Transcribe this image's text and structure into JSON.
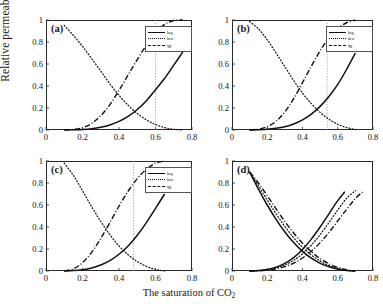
{
  "figure": {
    "ylabel": "Relative permeability",
    "xlabel_main": "The saturation of CO",
    "xlabel_sub": "2"
  },
  "legend": {
    "entries": [
      {
        "label": "krg",
        "style": "solid"
      },
      {
        "label": "krw",
        "style": "dotted"
      },
      {
        "label": "qg",
        "style": "dashdot"
      }
    ]
  },
  "panels": [
    {
      "tag": "(a)",
      "has_legend": true
    },
    {
      "tag": "(b)",
      "has_legend": true
    },
    {
      "tag": "(c)",
      "has_legend": true
    },
    {
      "tag": "(d)",
      "has_legend": false
    }
  ],
  "chart_data": {
    "type": "line",
    "title": "",
    "xlabel": "The saturation of CO2",
    "ylabel": "Relative permeability",
    "xlim": [
      0,
      0.8
    ],
    "ylim": [
      0,
      1
    ],
    "xticks": [
      0,
      0.2,
      0.4,
      0.6,
      0.8
    ],
    "yticks": [
      0,
      0.2,
      0.4,
      0.6,
      0.8,
      1
    ],
    "xtick_labels": [
      "0",
      "0.2",
      "0.4",
      "0.6",
      "0.8"
    ],
    "ytick_labels": [
      "0",
      "0.2",
      "0.4",
      "0.6",
      "0.8",
      "1"
    ],
    "grid": false,
    "legend_position": "upper right",
    "panels": [
      {
        "tag": "(a)",
        "vertical_reference_line": 0.6,
        "series": [
          {
            "name": "krg",
            "style": "solid",
            "x": [
              0.1,
              0.15,
              0.2,
              0.25,
              0.3,
              0.35,
              0.4,
              0.45,
              0.5,
              0.55,
              0.6,
              0.65,
              0.7,
              0.75
            ],
            "y": [
              0.0,
              0.002,
              0.005,
              0.012,
              0.025,
              0.046,
              0.078,
              0.124,
              0.186,
              0.266,
              0.366,
              0.47,
              0.59,
              0.71
            ]
          },
          {
            "name": "krw",
            "style": "dotted",
            "x": [
              0.1,
              0.15,
              0.2,
              0.25,
              0.3,
              0.35,
              0.4,
              0.45,
              0.5,
              0.55,
              0.6,
              0.65,
              0.7,
              0.75
            ],
            "y": [
              0.95,
              0.86,
              0.76,
              0.65,
              0.535,
              0.42,
              0.315,
              0.225,
              0.15,
              0.092,
              0.05,
              0.022,
              0.006,
              0.0
            ]
          },
          {
            "name": "qg",
            "style": "dashdot",
            "x": [
              0.1,
              0.15,
              0.2,
              0.25,
              0.3,
              0.35,
              0.4,
              0.45,
              0.5,
              0.55,
              0.6,
              0.65,
              0.7,
              0.75
            ],
            "y": [
              0.0,
              0.005,
              0.02,
              0.06,
              0.13,
              0.23,
              0.36,
              0.5,
              0.64,
              0.77,
              0.88,
              0.96,
              0.995,
              1.0
            ]
          }
        ]
      },
      {
        "tag": "(b)",
        "vertical_reference_line": 0.54,
        "series": [
          {
            "name": "krg",
            "style": "solid",
            "x": [
              0.1,
              0.15,
              0.2,
              0.25,
              0.3,
              0.35,
              0.4,
              0.45,
              0.5,
              0.55,
              0.6,
              0.65,
              0.7
            ],
            "y": [
              0.0,
              0.002,
              0.006,
              0.015,
              0.03,
              0.055,
              0.092,
              0.145,
              0.215,
              0.305,
              0.415,
              0.55,
              0.7
            ]
          },
          {
            "name": "krw",
            "style": "dotted",
            "x": [
              0.1,
              0.15,
              0.2,
              0.25,
              0.3,
              0.35,
              0.4,
              0.45,
              0.5,
              0.55,
              0.6,
              0.65,
              0.7
            ],
            "y": [
              0.985,
              0.92,
              0.82,
              0.7,
              0.575,
              0.45,
              0.335,
              0.24,
              0.16,
              0.098,
              0.052,
              0.022,
              0.005
            ]
          },
          {
            "name": "qg",
            "style": "dashdot",
            "x": [
              0.1,
              0.15,
              0.2,
              0.25,
              0.3,
              0.35,
              0.4,
              0.45,
              0.5,
              0.55,
              0.6,
              0.65,
              0.7
            ],
            "y": [
              0.0,
              0.008,
              0.03,
              0.08,
              0.165,
              0.285,
              0.43,
              0.58,
              0.72,
              0.84,
              0.925,
              0.975,
              1.0
            ]
          }
        ]
      },
      {
        "tag": "(c)",
        "vertical_reference_line": 0.48,
        "series": [
          {
            "name": "krg",
            "style": "solid",
            "x": [
              0.1,
              0.15,
              0.2,
              0.25,
              0.3,
              0.35,
              0.4,
              0.45,
              0.5,
              0.55,
              0.6,
              0.65
            ],
            "y": [
              0.0,
              0.004,
              0.012,
              0.028,
              0.055,
              0.095,
              0.152,
              0.228,
              0.325,
              0.44,
              0.57,
              0.7
            ]
          },
          {
            "name": "krw",
            "style": "dotted",
            "x": [
              0.1,
              0.15,
              0.2,
              0.25,
              0.3,
              0.35,
              0.4,
              0.45,
              0.5,
              0.55,
              0.6,
              0.65
            ],
            "y": [
              0.98,
              0.87,
              0.73,
              0.585,
              0.45,
              0.33,
              0.228,
              0.148,
              0.086,
              0.042,
              0.014,
              0.0
            ]
          },
          {
            "name": "qg",
            "style": "dashdot",
            "x": [
              0.1,
              0.15,
              0.2,
              0.25,
              0.3,
              0.35,
              0.4,
              0.45,
              0.5,
              0.55,
              0.6,
              0.65
            ],
            "y": [
              0.0,
              0.02,
              0.075,
              0.17,
              0.295,
              0.44,
              0.59,
              0.725,
              0.84,
              0.925,
              0.98,
              1.0
            ]
          }
        ]
      },
      {
        "tag": "(d)",
        "vertical_reference_line": null,
        "series": [
          {
            "name": "rising-solid",
            "style": "solid",
            "x": [
              0.1,
              0.15,
              0.2,
              0.25,
              0.3,
              0.35,
              0.4,
              0.45,
              0.5,
              0.55,
              0.6,
              0.64
            ],
            "y": [
              0.0,
              0.004,
              0.014,
              0.035,
              0.07,
              0.122,
              0.195,
              0.29,
              0.4,
              0.52,
              0.64,
              0.72
            ]
          },
          {
            "name": "rising-dotted",
            "style": "dotted",
            "x": [
              0.1,
              0.15,
              0.2,
              0.25,
              0.3,
              0.35,
              0.4,
              0.45,
              0.5,
              0.55,
              0.6,
              0.65,
              0.7
            ],
            "y": [
              0.0,
              0.003,
              0.011,
              0.027,
              0.055,
              0.097,
              0.156,
              0.235,
              0.33,
              0.44,
              0.555,
              0.66,
              0.73
            ]
          },
          {
            "name": "rising-dashdot",
            "style": "dashdot",
            "x": [
              0.1,
              0.15,
              0.2,
              0.25,
              0.3,
              0.35,
              0.4,
              0.45,
              0.5,
              0.55,
              0.6,
              0.65,
              0.7,
              0.75
            ],
            "y": [
              0.0,
              0.002,
              0.008,
              0.02,
              0.04,
              0.072,
              0.118,
              0.18,
              0.258,
              0.35,
              0.455,
              0.56,
              0.66,
              0.73
            ]
          },
          {
            "name": "falling-solid",
            "style": "solid",
            "x": [
              0.1,
              0.15,
              0.2,
              0.25,
              0.3,
              0.35,
              0.4,
              0.45,
              0.5,
              0.55,
              0.6,
              0.65,
              0.7
            ],
            "y": [
              0.9,
              0.745,
              0.6,
              0.47,
              0.355,
              0.258,
              0.178,
              0.116,
              0.07,
              0.038,
              0.017,
              0.005,
              0.0
            ]
          },
          {
            "name": "falling-dotted",
            "style": "dotted",
            "x": [
              0.1,
              0.15,
              0.2,
              0.25,
              0.3,
              0.35,
              0.4,
              0.45,
              0.5,
              0.55,
              0.6,
              0.65,
              0.7
            ],
            "y": [
              0.9,
              0.775,
              0.645,
              0.52,
              0.405,
              0.302,
              0.215,
              0.145,
              0.09,
              0.05,
              0.023,
              0.007,
              0.0
            ]
          },
          {
            "name": "falling-dashdot",
            "style": "dashdot",
            "x": [
              0.1,
              0.15,
              0.2,
              0.25,
              0.3,
              0.35,
              0.4,
              0.45,
              0.5,
              0.55,
              0.6,
              0.65,
              0.7
            ],
            "y": [
              0.9,
              0.8,
              0.685,
              0.565,
              0.45,
              0.345,
              0.252,
              0.175,
              0.113,
              0.066,
              0.032,
              0.011,
              0.0
            ]
          }
        ]
      }
    ]
  }
}
